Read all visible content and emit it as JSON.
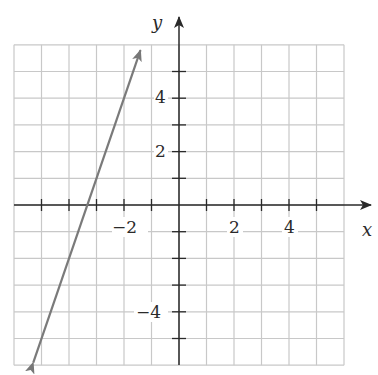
{
  "chart_data": {
    "type": "line",
    "title": "",
    "xlabel": "x",
    "ylabel": "y",
    "xlim": [
      -6,
      6
    ],
    "ylim": [
      -6,
      6
    ],
    "grid": true,
    "x_tick_labels": [
      "-2",
      "2",
      "4"
    ],
    "y_tick_labels": [
      "4",
      "2",
      "-4"
    ],
    "x_ticks": [
      -5,
      -4,
      -3,
      -2,
      -1,
      1,
      2,
      3,
      4,
      5
    ],
    "y_ticks": [
      -5,
      -4,
      -3,
      -2,
      -1,
      1,
      2,
      3,
      4,
      5
    ],
    "series": [
      {
        "name": "line",
        "equation": "y = 3x + 10",
        "x": [
          -5.3,
          -1.4
        ],
        "y": [
          -5.9,
          5.8
        ],
        "arrows": "both",
        "color": "#7a7a7a"
      }
    ]
  },
  "labels": {
    "x_axis": "x",
    "y_axis": "y",
    "xtick_neg2": "−2",
    "xtick_2": "2",
    "xtick_4": "4",
    "ytick_4": "4",
    "ytick_2": "2",
    "ytick_neg4": "−4"
  },
  "colors": {
    "grid": "#c8c8c8",
    "axis": "#2a2a2a",
    "line": "#777777"
  }
}
